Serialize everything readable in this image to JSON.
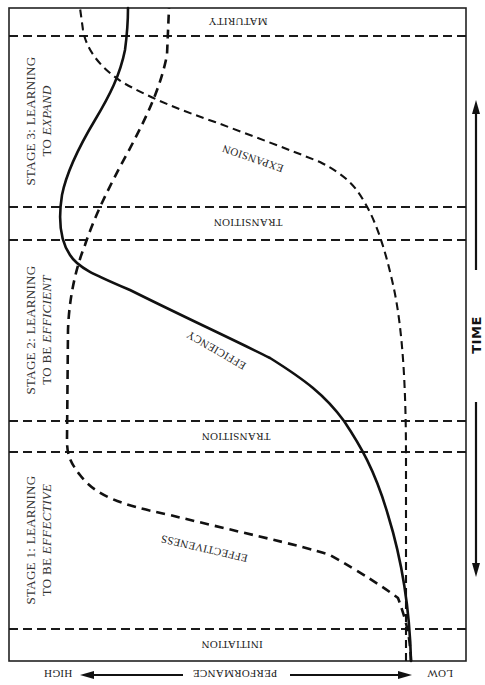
{
  "diagram": {
    "orientation": "rotated 180 degrees (text upside-down)",
    "phases": [
      {
        "id": "maturity",
        "label": "MATURITY"
      },
      {
        "id": "transition_upper",
        "label": "TRANSITION"
      },
      {
        "id": "transition_lower",
        "label": "TRANSITION"
      },
      {
        "id": "initiation",
        "label": "INITIATION"
      }
    ],
    "stages": [
      {
        "id": "stage3",
        "line1": "STAGE 3: LEARNING",
        "line2_prefix": "TO ",
        "line2_italic": "EXPAND"
      },
      {
        "id": "stage2",
        "line1": "STAGE 2: LEARNING",
        "line2_prefix": "TO BE ",
        "line2_italic": "EFFICIENT"
      },
      {
        "id": "stage1",
        "line1": "STAGE 1: LEARNING",
        "line2_prefix": "TO BE ",
        "line2_italic": "EFFECTIVE"
      }
    ],
    "curves": [
      {
        "id": "efficiency",
        "label": "EFFICIENCY",
        "style": "solid"
      },
      {
        "id": "effectiveness",
        "label": "EFFECTIVENESS",
        "style": "dashed"
      },
      {
        "id": "expansion",
        "label": "EXPANSION",
        "style": "dashed"
      }
    ],
    "axes": {
      "time_label": "TIME",
      "performance_label": "PERFORMANCE",
      "performance_high": "HIGH",
      "performance_low": "LOW"
    },
    "colors": {
      "ink": "#111111",
      "background": "#ffffff"
    }
  }
}
